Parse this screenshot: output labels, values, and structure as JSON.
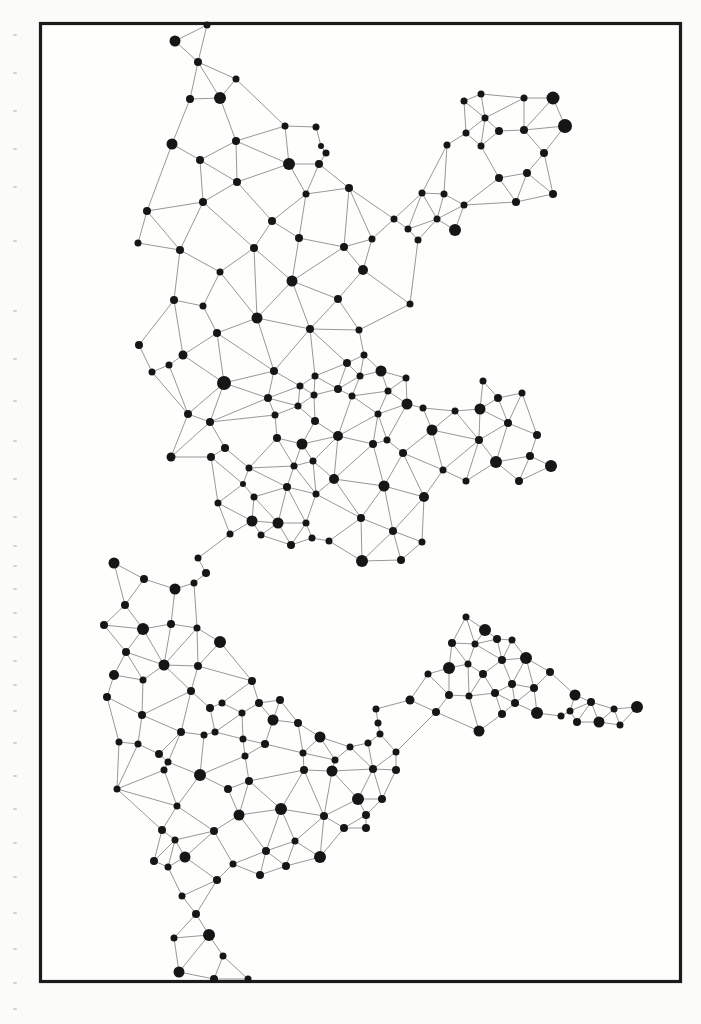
{
  "page": {
    "width": 701,
    "height": 1024,
    "paper_color": "#fbfbf9",
    "frame_fill": "#fefefd"
  },
  "frame": {
    "x": 40.5,
    "y": 23.5,
    "width": 640,
    "height": 958,
    "stroke": "#1b1b1b",
    "stroke_width": 3.2
  },
  "network": {
    "node_color": "#161616",
    "edge_color": "#7d7d7d",
    "edge_width": 0.8,
    "edge_rule": {
      "type": "gabriel",
      "max_distance": 72,
      "block_factor": 0.95
    },
    "nodes": [
      [
        207,
        25,
        3.5
      ],
      [
        175,
        41,
        5.5
      ],
      [
        198,
        62,
        4
      ],
      [
        236,
        79,
        3.5
      ],
      [
        190,
        99,
        4
      ],
      [
        220,
        98,
        6
      ],
      [
        285,
        126,
        3.5
      ],
      [
        316,
        127,
        3.5
      ],
      [
        236,
        141,
        4
      ],
      [
        321,
        146,
        3
      ],
      [
        326,
        153,
        3.5
      ],
      [
        172,
        144,
        5.5
      ],
      [
        289,
        164,
        6
      ],
      [
        319,
        164,
        4
      ],
      [
        200,
        160,
        4
      ],
      [
        237,
        182,
        4
      ],
      [
        349,
        188,
        4
      ],
      [
        306,
        194,
        3.5
      ],
      [
        203,
        202,
        4
      ],
      [
        147,
        211,
        4
      ],
      [
        272,
        221,
        4
      ],
      [
        299,
        238,
        4
      ],
      [
        138,
        243,
        3.5
      ],
      [
        180,
        250,
        4
      ],
      [
        254,
        248,
        4
      ],
      [
        220,
        272,
        3.5
      ],
      [
        422,
        193,
        3.5
      ],
      [
        444,
        194,
        3.5
      ],
      [
        437,
        219,
        3.5
      ],
      [
        394,
        219,
        3.5
      ],
      [
        408,
        229,
        3.5
      ],
      [
        418,
        240,
        3.5
      ],
      [
        455,
        230,
        6
      ],
      [
        464,
        205,
        3.5
      ],
      [
        447,
        145,
        3.5
      ],
      [
        466,
        133,
        3.5
      ],
      [
        464,
        101,
        3.5
      ],
      [
        372,
        239,
        3.5
      ],
      [
        344,
        247,
        4
      ],
      [
        481,
        94,
        3.5
      ],
      [
        524,
        98,
        3.5
      ],
      [
        553,
        98,
        6.5
      ],
      [
        485,
        118,
        3.5
      ],
      [
        499,
        131,
        4
      ],
      [
        524,
        130,
        4
      ],
      [
        565,
        126,
        7
      ],
      [
        481,
        146,
        3.5
      ],
      [
        544,
        153,
        4
      ],
      [
        499,
        178,
        4
      ],
      [
        527,
        173,
        4
      ],
      [
        553,
        194,
        4
      ],
      [
        516,
        202,
        4
      ],
      [
        174,
        300,
        4
      ],
      [
        203,
        306,
        3.5
      ],
      [
        292,
        281,
        5.5
      ],
      [
        363,
        270,
        5
      ],
      [
        338,
        299,
        4
      ],
      [
        410,
        304,
        3.5
      ],
      [
        257,
        318,
        5.5
      ],
      [
        310,
        329,
        4
      ],
      [
        359,
        330,
        3.5
      ],
      [
        217,
        333,
        4
      ],
      [
        183,
        355,
        4.5
      ],
      [
        139,
        345,
        4
      ],
      [
        152,
        372,
        3.5
      ],
      [
        169,
        365,
        3.5
      ],
      [
        224,
        383,
        7
      ],
      [
        274,
        371,
        4
      ],
      [
        315,
        376,
        3.5
      ],
      [
        347,
        363,
        4
      ],
      [
        364,
        355,
        3.5
      ],
      [
        381,
        371,
        5.5
      ],
      [
        360,
        376,
        3.5
      ],
      [
        314,
        395,
        3.5
      ],
      [
        338,
        389,
        4
      ],
      [
        268,
        398,
        4
      ],
      [
        300,
        386,
        3.5
      ],
      [
        352,
        396,
        3.5
      ],
      [
        388,
        391,
        3.5
      ],
      [
        406,
        378,
        3.5
      ],
      [
        407,
        404,
        5.5
      ],
      [
        423,
        408,
        3.5
      ],
      [
        455,
        411,
        3.5
      ],
      [
        188,
        414,
        4
      ],
      [
        210,
        422,
        4
      ],
      [
        225,
        448,
        4
      ],
      [
        171,
        457,
        4.5
      ],
      [
        211,
        457,
        4
      ],
      [
        298,
        406,
        3.5
      ],
      [
        275,
        415,
        3.5
      ],
      [
        315,
        421,
        4
      ],
      [
        277,
        438,
        4
      ],
      [
        302,
        444,
        5.5
      ],
      [
        338,
        436,
        5
      ],
      [
        378,
        414,
        3.5
      ],
      [
        373,
        444,
        4
      ],
      [
        387,
        440,
        3.5
      ],
      [
        403,
        453,
        4
      ],
      [
        432,
        430,
        5.5
      ],
      [
        443,
        470,
        3.5
      ],
      [
        313,
        461,
        3.5
      ],
      [
        294,
        466,
        3.5
      ],
      [
        249,
        468,
        3.5
      ],
      [
        243,
        484,
        3
      ],
      [
        287,
        487,
        4
      ],
      [
        334,
        479,
        5
      ],
      [
        384,
        486,
        5.5
      ],
      [
        424,
        497,
        5
      ],
      [
        316,
        494,
        3.5
      ],
      [
        254,
        497,
        3.5
      ],
      [
        218,
        503,
        3.5
      ],
      [
        252,
        521,
        5.5
      ],
      [
        278,
        523,
        5.5
      ],
      [
        306,
        523,
        3.5
      ],
      [
        261,
        535,
        3.5
      ],
      [
        291,
        545,
        4
      ],
      [
        312,
        538,
        3.5
      ],
      [
        329,
        541,
        3.5
      ],
      [
        361,
        518,
        4
      ],
      [
        393,
        531,
        4
      ],
      [
        422,
        542,
        3.5
      ],
      [
        362,
        561,
        6
      ],
      [
        401,
        560,
        4
      ],
      [
        230,
        534,
        3.5
      ],
      [
        483,
        381,
        3.5
      ],
      [
        498,
        398,
        4
      ],
      [
        522,
        393,
        3.5
      ],
      [
        480,
        409,
        5.5
      ],
      [
        508,
        423,
        4
      ],
      [
        537,
        435,
        4
      ],
      [
        479,
        440,
        4
      ],
      [
        496,
        462,
        6
      ],
      [
        530,
        456,
        4
      ],
      [
        551,
        466,
        6
      ],
      [
        519,
        481,
        4
      ],
      [
        466,
        481,
        3.5
      ],
      [
        114,
        563,
        5.5
      ],
      [
        144,
        579,
        4
      ],
      [
        175,
        589,
        5.5
      ],
      [
        198,
        558,
        3.5
      ],
      [
        206,
        573,
        4
      ],
      [
        194,
        583,
        3.5
      ],
      [
        125,
        605,
        4
      ],
      [
        104,
        625,
        4
      ],
      [
        143,
        629,
        6
      ],
      [
        171,
        624,
        4
      ],
      [
        197,
        628,
        3.5
      ],
      [
        220,
        642,
        6
      ],
      [
        126,
        652,
        4
      ],
      [
        164,
        665,
        5.5
      ],
      [
        198,
        666,
        4
      ],
      [
        114,
        675,
        5
      ],
      [
        143,
        680,
        3.5
      ],
      [
        107,
        697,
        4
      ],
      [
        142,
        715,
        4
      ],
      [
        191,
        691,
        4
      ],
      [
        210,
        708,
        4
      ],
      [
        222,
        703,
        3.5
      ],
      [
        181,
        732,
        4
      ],
      [
        204,
        735,
        3.5
      ],
      [
        215,
        732,
        3.5
      ],
      [
        119,
        742,
        3.5
      ],
      [
        138,
        744,
        3.5
      ],
      [
        159,
        754,
        4
      ],
      [
        168,
        762,
        3.5
      ],
      [
        252,
        681,
        4
      ],
      [
        259,
        703,
        4
      ],
      [
        280,
        700,
        4
      ],
      [
        273,
        720,
        5.5
      ],
      [
        242,
        713,
        3.5
      ],
      [
        243,
        739,
        3.5
      ],
      [
        265,
        744,
        4
      ],
      [
        298,
        723,
        4
      ],
      [
        320,
        737,
        5.5
      ],
      [
        303,
        753,
        3.5
      ],
      [
        245,
        756,
        3.5
      ],
      [
        249,
        781,
        4
      ],
      [
        239,
        815,
        5.5
      ],
      [
        281,
        809,
        6
      ],
      [
        304,
        770,
        4
      ],
      [
        332,
        771,
        5.5
      ],
      [
        358,
        799,
        6
      ],
      [
        373,
        769,
        4
      ],
      [
        396,
        770,
        4
      ],
      [
        382,
        799,
        4
      ],
      [
        324,
        816,
        4
      ],
      [
        344,
        828,
        4
      ],
      [
        366,
        815,
        4
      ],
      [
        366,
        828,
        4
      ],
      [
        295,
        841,
        3.5
      ],
      [
        266,
        851,
        4
      ],
      [
        286,
        866,
        4
      ],
      [
        320,
        857,
        6
      ],
      [
        260,
        875,
        4
      ],
      [
        233,
        864,
        3.5
      ],
      [
        350,
        747,
        3.5
      ],
      [
        368,
        743,
        3.5
      ],
      [
        376,
        709,
        3.5
      ],
      [
        378,
        723,
        3.5
      ],
      [
        380,
        734,
        3.5
      ],
      [
        396,
        752,
        3.5
      ],
      [
        335,
        760,
        3.5
      ],
      [
        410,
        700,
        4.5
      ],
      [
        428,
        674,
        3.5
      ],
      [
        436,
        712,
        4
      ],
      [
        452,
        643,
        4
      ],
      [
        449,
        668,
        6
      ],
      [
        468,
        664,
        3.5
      ],
      [
        449,
        695,
        4
      ],
      [
        466,
        617,
        3.5
      ],
      [
        485,
        630,
        6
      ],
      [
        497,
        639,
        4
      ],
      [
        512,
        640,
        3.5
      ],
      [
        475,
        644,
        3.5
      ],
      [
        502,
        660,
        4
      ],
      [
        526,
        658,
        6
      ],
      [
        483,
        674,
        4
      ],
      [
        550,
        672,
        4
      ],
      [
        512,
        684,
        4
      ],
      [
        534,
        688,
        4
      ],
      [
        495,
        693,
        4
      ],
      [
        469,
        696,
        3.5
      ],
      [
        515,
        703,
        4
      ],
      [
        575,
        695,
        5.5
      ],
      [
        591,
        702,
        4
      ],
      [
        502,
        714,
        4
      ],
      [
        537,
        713,
        6
      ],
      [
        561,
        716,
        3.5
      ],
      [
        570,
        711,
        3.5
      ],
      [
        577,
        722,
        4
      ],
      [
        599,
        722,
        5.5
      ],
      [
        614,
        709,
        3.5
      ],
      [
        620,
        725,
        3.5
      ],
      [
        637,
        707,
        6
      ],
      [
        479,
        731,
        5.5
      ],
      [
        117,
        789,
        3.5
      ],
      [
        164,
        770,
        3.5
      ],
      [
        200,
        775,
        6
      ],
      [
        228,
        789,
        4
      ],
      [
        177,
        806,
        3.5
      ],
      [
        162,
        830,
        4
      ],
      [
        175,
        840,
        3.5
      ],
      [
        154,
        861,
        4
      ],
      [
        168,
        867,
        3.5
      ],
      [
        185,
        857,
        5.5
      ],
      [
        214,
        831,
        4
      ],
      [
        217,
        880,
        4
      ],
      [
        182,
        896,
        3.5
      ],
      [
        196,
        914,
        4
      ],
      [
        174,
        938,
        3.5
      ],
      [
        209,
        935,
        6
      ],
      [
        223,
        956,
        3.5
      ],
      [
        179,
        972,
        5.5
      ],
      [
        214,
        979,
        4
      ],
      [
        248,
        979,
        3.5
      ]
    ]
  },
  "margin_marks": {
    "x": 13,
    "width": 4,
    "height": 2,
    "color": "#d2d2cf",
    "ys": [
      34,
      72,
      110,
      148,
      186,
      240,
      310,
      358,
      400,
      440,
      478,
      516,
      545,
      565,
      588,
      612,
      636,
      660,
      684,
      710,
      742,
      775,
      808,
      842,
      876,
      912,
      948,
      982,
      1008
    ]
  }
}
